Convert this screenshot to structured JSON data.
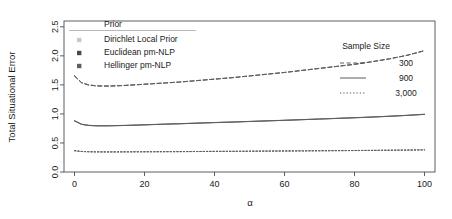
{
  "chart_data": {
    "type": "line",
    "title": "",
    "xlabel": "α",
    "ylabel": "Total Situational Error",
    "xlim": [
      -3,
      103
    ],
    "ylim": [
      0.0,
      2.6
    ],
    "xticks": [
      0,
      20,
      40,
      60,
      80,
      100
    ],
    "xtick_labels": [
      "0",
      "20",
      "40",
      "60",
      "80",
      "100"
    ],
    "yticks": [
      0.0,
      0.5,
      1.0,
      1.5,
      2.0,
      2.5
    ],
    "ytick_labels": [
      "0.0",
      "0.5",
      "1.0",
      "1.5",
      "2.0",
      "2.5"
    ],
    "grid": false,
    "x": [
      0,
      2,
      4,
      6,
      8,
      10,
      14,
      18,
      22,
      26,
      30,
      35,
      40,
      45,
      50,
      55,
      60,
      65,
      70,
      75,
      80,
      85,
      90,
      95,
      100
    ],
    "series": [
      {
        "name": "300 / Dirichlet Local Prior",
        "sample_size": 300,
        "prior": "Dirichlet Local Prior",
        "linestyle": "dashed",
        "color": "#8a8a8a",
        "values": [
          1.66,
          1.54,
          1.5,
          1.485,
          1.48,
          1.48,
          1.49,
          1.505,
          1.52,
          1.535,
          1.55,
          1.575,
          1.6,
          1.625,
          1.655,
          1.685,
          1.715,
          1.75,
          1.785,
          1.82,
          1.855,
          1.9,
          1.95,
          2.01,
          2.09
        ]
      },
      {
        "name": "300 / Euclidean pm-NLP",
        "sample_size": 300,
        "prior": "Euclidean pm-NLP",
        "linestyle": "dashed",
        "color": "#4a4a4a",
        "values": [
          1.65,
          1.535,
          1.497,
          1.483,
          1.479,
          1.479,
          1.488,
          1.503,
          1.518,
          1.533,
          1.548,
          1.573,
          1.598,
          1.623,
          1.653,
          1.683,
          1.713,
          1.748,
          1.783,
          1.818,
          1.853,
          1.898,
          1.948,
          2.008,
          2.088
        ]
      },
      {
        "name": "300 / Hellinger pm-NLP",
        "sample_size": 300,
        "prior": "Hellinger pm-NLP",
        "linestyle": "dashed",
        "color": "#5f5f5f",
        "values": [
          1.655,
          1.54,
          1.5,
          1.486,
          1.481,
          1.481,
          1.49,
          1.504,
          1.519,
          1.534,
          1.549,
          1.574,
          1.599,
          1.624,
          1.654,
          1.684,
          1.714,
          1.749,
          1.784,
          1.819,
          1.854,
          1.899,
          1.949,
          2.009,
          2.089
        ]
      },
      {
        "name": "900 / Dirichlet Local Prior",
        "sample_size": 900,
        "prior": "Dirichlet Local Prior",
        "linestyle": "solid",
        "color": "#8a8a8a",
        "values": [
          0.885,
          0.825,
          0.805,
          0.798,
          0.797,
          0.798,
          0.803,
          0.81,
          0.818,
          0.826,
          0.833,
          0.843,
          0.853,
          0.862,
          0.872,
          0.882,
          0.892,
          0.903,
          0.914,
          0.925,
          0.936,
          0.948,
          0.962,
          0.977,
          0.995
        ]
      },
      {
        "name": "900 / Euclidean pm-NLP",
        "sample_size": 900,
        "prior": "Euclidean pm-NLP",
        "linestyle": "solid",
        "color": "#4a4a4a",
        "values": [
          0.88,
          0.82,
          0.801,
          0.795,
          0.794,
          0.795,
          0.8,
          0.807,
          0.815,
          0.823,
          0.83,
          0.84,
          0.85,
          0.859,
          0.869,
          0.879,
          0.889,
          0.9,
          0.911,
          0.922,
          0.933,
          0.945,
          0.959,
          0.974,
          0.992
        ]
      },
      {
        "name": "900 / Hellinger pm-NLP",
        "sample_size": 900,
        "prior": "Hellinger pm-NLP",
        "linestyle": "solid",
        "color": "#5f5f5f",
        "values": [
          0.882,
          0.822,
          0.803,
          0.796,
          0.795,
          0.796,
          0.801,
          0.808,
          0.816,
          0.824,
          0.831,
          0.841,
          0.851,
          0.86,
          0.87,
          0.88,
          0.89,
          0.901,
          0.912,
          0.923,
          0.934,
          0.946,
          0.96,
          0.975,
          0.993
        ]
      },
      {
        "name": "3,000 / Dirichlet Local Prior",
        "sample_size": 3000,
        "prior": "Dirichlet Local Prior",
        "linestyle": "dotted",
        "color": "#8a8a8a",
        "values": [
          0.368,
          0.355,
          0.35,
          0.348,
          0.347,
          0.347,
          0.348,
          0.349,
          0.35,
          0.351,
          0.352,
          0.354,
          0.356,
          0.357,
          0.359,
          0.361,
          0.363,
          0.365,
          0.367,
          0.369,
          0.371,
          0.373,
          0.376,
          0.379,
          0.383
        ]
      },
      {
        "name": "3,000 / Euclidean pm-NLP",
        "sample_size": 3000,
        "prior": "Euclidean pm-NLP",
        "linestyle": "dotted",
        "color": "#4a4a4a",
        "values": [
          0.366,
          0.353,
          0.348,
          0.346,
          0.345,
          0.345,
          0.346,
          0.347,
          0.348,
          0.349,
          0.35,
          0.352,
          0.354,
          0.355,
          0.357,
          0.359,
          0.361,
          0.363,
          0.365,
          0.367,
          0.369,
          0.371,
          0.374,
          0.377,
          0.381
        ]
      },
      {
        "name": "3,000 / Hellinger pm-NLP",
        "sample_size": 3000,
        "prior": "Hellinger pm-NLP",
        "linestyle": "dotted",
        "color": "#5f5f5f",
        "values": [
          0.367,
          0.354,
          0.349,
          0.347,
          0.346,
          0.346,
          0.347,
          0.348,
          0.349,
          0.35,
          0.351,
          0.353,
          0.355,
          0.356,
          0.358,
          0.36,
          0.362,
          0.364,
          0.366,
          0.368,
          0.37,
          0.372,
          0.375,
          0.378,
          0.382
        ]
      }
    ],
    "legends": [
      {
        "id": "prior",
        "title": "Prior",
        "position": "top-left-inside",
        "marker": "square",
        "entries": [
          {
            "label": "Dirichlet Local Prior",
            "color": "#c9c9c9"
          },
          {
            "label": "Euclidean pm-NLP",
            "color": "#4a4a4a"
          },
          {
            "label": "Hellinger pm-NLP",
            "color": "#5f5f5f"
          }
        ]
      },
      {
        "id": "sample-size",
        "title": "Sample Size",
        "position": "right-inside",
        "marker": "line",
        "entries": [
          {
            "label": "300",
            "linestyle": "dashed",
            "color": "#4a4a4a"
          },
          {
            "label": "900",
            "linestyle": "solid",
            "color": "#4a4a4a"
          },
          {
            "label": "3,000",
            "linestyle": "dotted",
            "color": "#4a4a4a"
          }
        ]
      }
    ]
  }
}
